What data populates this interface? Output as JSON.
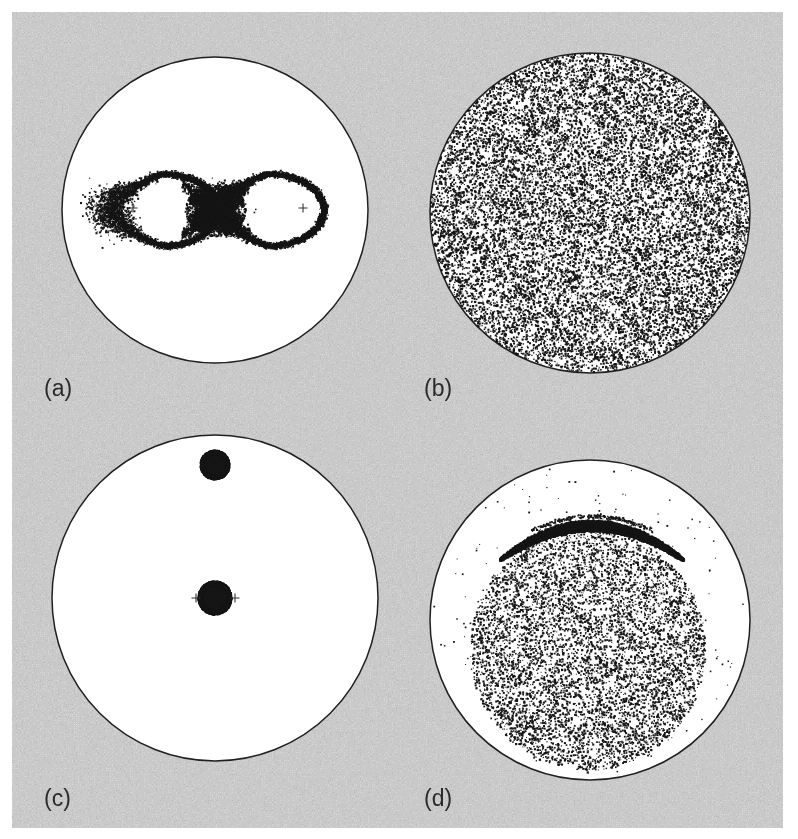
{
  "figure": {
    "kind": "poincare-surface-of-section-grid",
    "caption_labels": [
      "(a)",
      "(b)",
      "(c)",
      "(d)"
    ],
    "background_color": "#c9c9c9",
    "page_color": "#ffffff",
    "ink_color": "#151515",
    "disk_fill_color": "#ffffff",
    "disk_outline_color": "#202020",
    "width": 798,
    "height": 839,
    "plot_area": {
      "x": 12,
      "y": 12,
      "width": 771,
      "height": 816
    }
  },
  "panels": [
    {
      "id": "a",
      "label": "(a)",
      "label_x": 44,
      "label_y": 377,
      "disk": {
        "cx": 215,
        "cy": 210,
        "r": 153
      },
      "description": "figure-eight separatrix with two elliptic fixed points",
      "structure_type": "separatrix",
      "markers": [
        {
          "name": "plus-marker-left",
          "x": 133,
          "y": 208,
          "glyph": "+"
        },
        {
          "name": "plus-marker-right",
          "x": 303,
          "y": 208,
          "glyph": "+"
        }
      ],
      "figure_eight": {
        "center_x": 216,
        "center_y": 210,
        "lobe_half_width": 54,
        "lobe_half_height": 36,
        "lobe_offset": 53,
        "point_count": 5200,
        "line_jitter": 1.7,
        "crossing_jitter": 9.0,
        "crossing_density": 3400,
        "crossing_half_width": 30,
        "crossing_half_height": 27
      }
    },
    {
      "id": "b",
      "label": "(b)",
      "label_x": 424,
      "label_y": 377,
      "disk": {
        "cx": 590,
        "cy": 213,
        "r": 160
      },
      "description": "fully ergodic chaotic sea filling the whole disk",
      "structure_type": "chaotic-sea-full",
      "markers": [],
      "scatter": {
        "point_count": 13500,
        "fill_fraction": 1.0,
        "dot_size_min": 0.9,
        "dot_size_max": 2.3,
        "edge_bias": 0.06
      }
    },
    {
      "id": "c",
      "label": "(c)",
      "label_x": 44,
      "label_y": 787,
      "disk": {
        "cx": 215,
        "cy": 598,
        "r": 163
      },
      "description": "two isolated dense islands: one at the centre, one above",
      "structure_type": "islands",
      "markers": [
        {
          "name": "plus-marker-left",
          "x": 196,
          "y": 598,
          "glyph": "+"
        },
        {
          "name": "plus-marker-right",
          "x": 235,
          "y": 598,
          "glyph": "+"
        }
      ],
      "blobs": [
        {
          "name": "upper-island",
          "cx": 215,
          "cy": 465,
          "r": 13.5,
          "point_count": 2600
        },
        {
          "name": "central-island",
          "cx": 215,
          "cy": 598,
          "r": 15.5,
          "point_count": 3200
        }
      ]
    },
    {
      "id": "d",
      "label": "(d)",
      "label_x": 424,
      "label_y": 787,
      "disk": {
        "cx": 590,
        "cy": 620,
        "r": 160
      },
      "description": "thin crescent island chain above a chaotic sea",
      "structure_type": "crescent-plus-chaos",
      "markers": [],
      "crescent": {
        "cx": 592,
        "cy": 560,
        "half_width": 92,
        "arc_rise": 34,
        "max_thickness": 5.4,
        "point_count": 4200
      },
      "scatter": {
        "point_count": 6400,
        "region_cx": 588,
        "region_cy": 650,
        "region_rx": 118,
        "region_ry": 120,
        "dot_size_min": 0.9,
        "dot_size_max": 2.2,
        "sparse_halo_count": 120
      }
    }
  ]
}
